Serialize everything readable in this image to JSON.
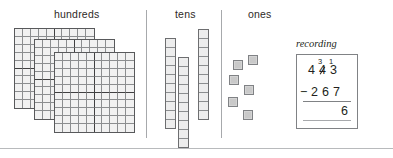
{
  "columns": {
    "hundreds": {
      "label": "hundreds",
      "flat_count": 3,
      "grid_rows": 10,
      "grid_cols": 10
    },
    "tens": {
      "label": "tens",
      "rod_count": 3,
      "units_per_rod": 10
    },
    "ones": {
      "label": "ones",
      "cube_count": 6
    }
  },
  "ones_cubes": [
    {
      "x": 233,
      "y": 60
    },
    {
      "x": 248,
      "y": 55
    },
    {
      "x": 229,
      "y": 75
    },
    {
      "x": 244,
      "y": 85
    },
    {
      "x": 228,
      "y": 97
    },
    {
      "x": 243,
      "y": 110
    }
  ],
  "recording": {
    "caption": "recording",
    "minuend_digits": [
      "4",
      "4",
      "3"
    ],
    "regroup_tens": "3",
    "regroup_ones": "1",
    "operator": "−",
    "subtrahend_digits": [
      "2",
      "6",
      "7"
    ],
    "difference": "6"
  },
  "colors": {
    "ink": "#231f20",
    "rule": "#808285",
    "divider": "#a7a9ac",
    "flat_fill": "#f1f1f1",
    "flat_border": "#58595b",
    "grid_line": "#8b8d8f",
    "grid_major": "#404041",
    "cube_fill": "#c9c9c9",
    "cube_border": "#808285"
  }
}
